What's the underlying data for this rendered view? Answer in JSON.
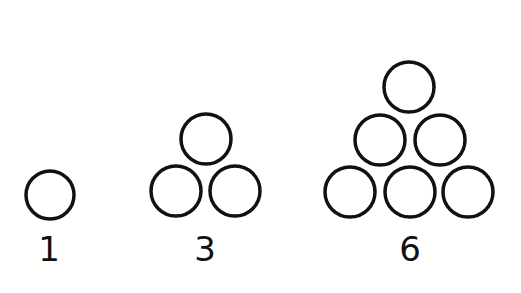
{
  "stroke_color": "#111111",
  "background": "#ffffff",
  "groups": [
    {
      "label": "1",
      "label_pos": {
        "x": 49,
        "y": 232
      },
      "circles": [
        {
          "cx": 50,
          "cy": 195,
          "r": 24
        }
      ]
    },
    {
      "label": "3",
      "label_pos": {
        "x": 205,
        "y": 232
      },
      "circles": [
        {
          "cx": 206,
          "cy": 139,
          "r": 25
        },
        {
          "cx": 176,
          "cy": 191,
          "r": 25
        },
        {
          "cx": 235,
          "cy": 191,
          "r": 25
        }
      ]
    },
    {
      "label": "6",
      "label_pos": {
        "x": 410,
        "y": 232
      },
      "circles": [
        {
          "cx": 409,
          "cy": 87,
          "r": 25
        },
        {
          "cx": 380,
          "cy": 140,
          "r": 25
        },
        {
          "cx": 440,
          "cy": 140,
          "r": 25
        },
        {
          "cx": 350,
          "cy": 192,
          "r": 25
        },
        {
          "cx": 410,
          "cy": 192,
          "r": 25
        },
        {
          "cx": 468,
          "cy": 192,
          "r": 25
        }
      ]
    }
  ]
}
